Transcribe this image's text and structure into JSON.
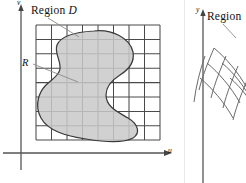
{
  "figure": {
    "kind": "math-textbook-figure",
    "panel_count": 2,
    "background_color": "#ffffff"
  },
  "left_panel": {
    "name": "uv-plane",
    "axes": {
      "vertical_label": "v",
      "horizontal_label": "u",
      "axis_color": "#555555"
    },
    "labels": {
      "region_text": "Region ",
      "region_italic": "D",
      "cell_label": "R"
    },
    "grid": {
      "columns": 8,
      "rows": 8,
      "line_color": "#4a4a4a",
      "x_start": 36,
      "x_end": 160,
      "y_start": 25,
      "y_end": 140,
      "cell_w": 15.5,
      "cell_h": 14.4
    },
    "region": {
      "fill_color": "#c9c9c9",
      "stroke_color": "#3a3a3a",
      "shape": "closed smooth blob with concave notch on right side"
    }
  },
  "right_panel": {
    "name": "xy-plane",
    "clipped": true,
    "axes": {
      "vertical_label": "y",
      "axis_color": "#555555"
    },
    "labels": {
      "region_text": "Region"
    },
    "grid": {
      "line_color": "#6a6a6a",
      "style": "skewed curvilinear mesh",
      "u_lines": 5,
      "v_lines": 5
    }
  },
  "colors": {
    "region_fill": "#c9c9c9",
    "grid_dark": "#4a4a4a",
    "axis": "#555555",
    "leader_line": "#8a8a8a",
    "text": "#111111"
  }
}
